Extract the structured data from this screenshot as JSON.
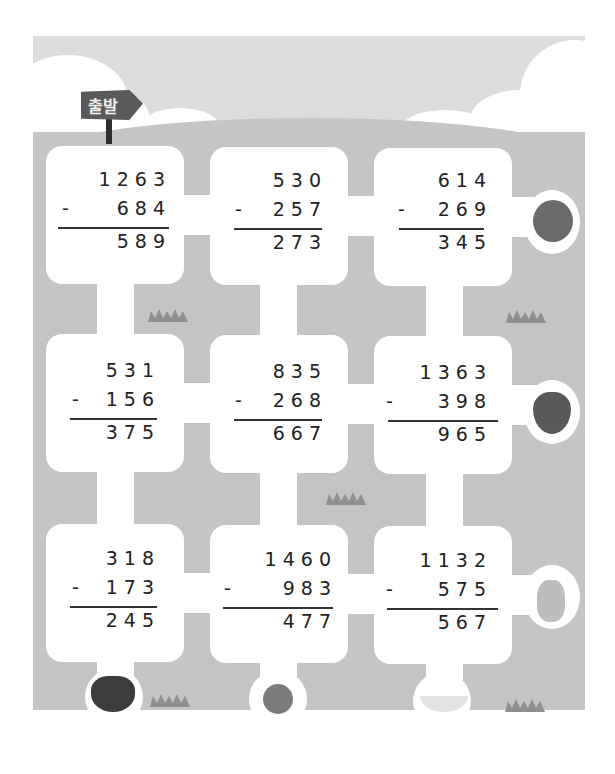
{
  "sign": {
    "label": "출발",
    "icon": "signpost-icon"
  },
  "problems": [
    {
      "row": 1,
      "col": 1,
      "minuend": "1 2 6 3",
      "operator": "-",
      "subtrahend": "6 8 4",
      "difference": "5 8 9"
    },
    {
      "row": 1,
      "col": 2,
      "minuend": "5 3 0",
      "operator": "-",
      "subtrahend": "2 5 7",
      "difference": "2 7 3"
    },
    {
      "row": 1,
      "col": 3,
      "minuend": "6 1 4",
      "operator": "-",
      "subtrahend": "2 6 9",
      "difference": "3 4 5"
    },
    {
      "row": 2,
      "col": 1,
      "minuend": "5 3 1",
      "operator": "-",
      "subtrahend": "1 5 6",
      "difference": "3 7 5"
    },
    {
      "row": 2,
      "col": 2,
      "minuend": "8 3 5",
      "operator": "-",
      "subtrahend": "2 6 8",
      "difference": "6 6 7"
    },
    {
      "row": 2,
      "col": 3,
      "minuend": "1 3 6 3",
      "operator": "-",
      "subtrahend": "3 9 8",
      "difference": "9 6 5"
    },
    {
      "row": 3,
      "col": 1,
      "minuend": "3 1 8",
      "operator": "-",
      "subtrahend": "1 7 3",
      "difference": "2 4 5"
    },
    {
      "row": 3,
      "col": 2,
      "minuend": "1 4 6 0",
      "operator": "-",
      "subtrahend": "9 8 3",
      "difference": "4 7 7"
    },
    {
      "row": 3,
      "col": 3,
      "minuend": "1 1 3 2",
      "operator": "-",
      "subtrahend": "5 7 5",
      "difference": "5 6 7"
    }
  ],
  "fruits": [
    {
      "name": "apple",
      "icon": "apple-icon",
      "color": "#6a6a6a"
    },
    {
      "name": "strawberry",
      "icon": "strawberry-icon",
      "color": "#595959"
    },
    {
      "name": "pineapple",
      "icon": "pineapple-icon",
      "color": "#bdbdbd"
    },
    {
      "name": "grapes",
      "icon": "grapes-icon",
      "color": "#3c3c3c"
    },
    {
      "name": "orange",
      "icon": "orange-icon",
      "color": "#7b7b7b"
    },
    {
      "name": "banana",
      "icon": "banana-icon",
      "color": "#e3e3e3"
    }
  ],
  "colors": {
    "sky": "#dcdcdc",
    "ground": "#c4c4c4",
    "path": "#ffffff",
    "sign": "#5a5a5a"
  }
}
